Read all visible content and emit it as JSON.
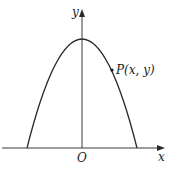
{
  "diagram": {
    "type": "parabola-graph",
    "axes": {
      "x_label": "x",
      "y_label": "y",
      "origin_label": "O"
    },
    "curve": {
      "description": "downward-opening parabola symmetric about the y-axis",
      "vertex_px": [
        82,
        39
      ],
      "roots_px": [
        27,
        137
      ]
    },
    "point": {
      "label": "P(x, y)",
      "position_px": [
        112,
        70
      ]
    },
    "colors": {
      "line": "#2a2a2a",
      "background": "#ffffff"
    }
  }
}
